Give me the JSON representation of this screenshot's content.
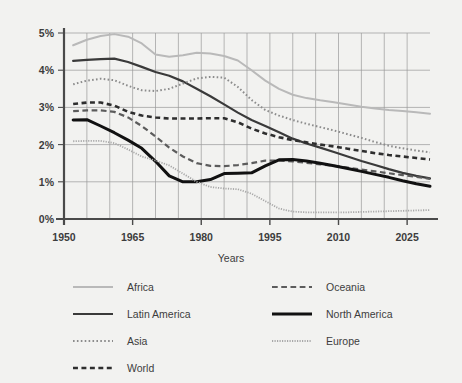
{
  "chart_data": {
    "type": "line",
    "title": "",
    "xlabel": "Years",
    "ylabel": "",
    "xlim": [
      1950,
      2030
    ],
    "ylim": [
      0,
      5
    ],
    "grid": true,
    "legend_position": "bottom",
    "y_ticks": [
      "0%",
      "1%",
      "2%",
      "3%",
      "4%",
      "5%"
    ],
    "y_tick_values": [
      0,
      1,
      2,
      3,
      4,
      5
    ],
    "x_ticks": [
      "1950",
      "1965",
      "1980",
      "1995",
      "2010",
      "2025"
    ],
    "x_tick_values": [
      1950,
      1965,
      1980,
      1995,
      2010,
      2025
    ],
    "x_minor_step": 5,
    "series": [
      {
        "name": "Africa",
        "color": "#b9b9b9",
        "style": "solid",
        "width": 2.0,
        "x": [
          1952,
          1955,
          1958,
          1961,
          1964,
          1967,
          1970,
          1973,
          1976,
          1979,
          1982,
          1985,
          1988,
          1991,
          1994,
          1997,
          2000,
          2003,
          2006,
          2009,
          2012,
          2015,
          2018,
          2021,
          2024,
          2027,
          2030
        ],
        "values": [
          4.67,
          4.82,
          4.92,
          4.97,
          4.9,
          4.72,
          4.42,
          4.36,
          4.4,
          4.47,
          4.45,
          4.38,
          4.26,
          4.0,
          3.72,
          3.5,
          3.34,
          3.25,
          3.19,
          3.14,
          3.08,
          3.02,
          2.97,
          2.93,
          2.9,
          2.87,
          2.83
        ]
      },
      {
        "name": "Latin America",
        "color": "#3a3a3a",
        "style": "solid",
        "width": 2.2,
        "x": [
          1952,
          1955,
          1958,
          1961,
          1964,
          1967,
          1970,
          1973,
          1976,
          1979,
          1982,
          1985,
          1988,
          1991,
          1994,
          1997,
          2000,
          2003,
          2006,
          2009,
          2012,
          2015,
          2018,
          2021,
          2024,
          2027,
          2030
        ],
        "values": [
          4.25,
          4.28,
          4.3,
          4.31,
          4.22,
          4.09,
          3.95,
          3.85,
          3.7,
          3.5,
          3.3,
          3.08,
          2.86,
          2.66,
          2.5,
          2.33,
          2.16,
          2.03,
          1.92,
          1.8,
          1.68,
          1.56,
          1.45,
          1.34,
          1.24,
          1.16,
          1.09
        ]
      },
      {
        "name": "Asia",
        "color": "#8c8c8c",
        "style": "dotted-fine",
        "width": 2.0,
        "x": [
          1952,
          1955,
          1958,
          1961,
          1964,
          1967,
          1970,
          1973,
          1976,
          1979,
          1982,
          1985,
          1988,
          1991,
          1994,
          1997,
          2000,
          2003,
          2006,
          2009,
          2012,
          2015,
          2018,
          2021,
          2024,
          2027,
          2030
        ],
        "values": [
          3.62,
          3.72,
          3.77,
          3.73,
          3.58,
          3.46,
          3.44,
          3.5,
          3.64,
          3.78,
          3.82,
          3.8,
          3.55,
          3.2,
          2.93,
          2.78,
          2.66,
          2.56,
          2.47,
          2.38,
          2.28,
          2.18,
          2.07,
          1.97,
          1.9,
          1.84,
          1.79
        ]
      },
      {
        "name": "World",
        "color": "#2e2e2e",
        "style": "dashed-thick",
        "width": 2.6,
        "x": [
          1952,
          1955,
          1958,
          1961,
          1964,
          1967,
          1970,
          1973,
          1976,
          1979,
          1982,
          1985,
          1988,
          1991,
          1994,
          1997,
          2000,
          2003,
          2006,
          2009,
          2012,
          2015,
          2018,
          2021,
          2024,
          2027,
          2030
        ],
        "values": [
          3.09,
          3.13,
          3.13,
          3.05,
          2.88,
          2.78,
          2.73,
          2.7,
          2.7,
          2.7,
          2.71,
          2.71,
          2.6,
          2.43,
          2.3,
          2.2,
          2.12,
          2.06,
          2.0,
          1.95,
          1.89,
          1.83,
          1.77,
          1.72,
          1.68,
          1.64,
          1.6
        ]
      },
      {
        "name": "Oceania",
        "color": "#5c5c5c",
        "style": "dashed",
        "width": 2.2,
        "x": [
          1952,
          1955,
          1958,
          1961,
          1964,
          1967,
          1970,
          1973,
          1976,
          1979,
          1982,
          1985,
          1988,
          1991,
          1994,
          1997,
          2000,
          2003,
          2006,
          2009,
          2012,
          2015,
          2018,
          2021,
          2024,
          2027,
          2030
        ],
        "values": [
          2.9,
          2.92,
          2.92,
          2.88,
          2.73,
          2.5,
          2.22,
          1.92,
          1.68,
          1.5,
          1.43,
          1.42,
          1.45,
          1.5,
          1.57,
          1.57,
          1.55,
          1.51,
          1.47,
          1.43,
          1.38,
          1.33,
          1.28,
          1.23,
          1.18,
          1.13,
          1.08
        ]
      },
      {
        "name": "North America",
        "color": "#111111",
        "style": "solid",
        "width": 3.0,
        "x": [
          1952,
          1955,
          1958,
          1961,
          1964,
          1967,
          1970,
          1973,
          1976,
          1979,
          1982,
          1985,
          1988,
          1991,
          1994,
          1997,
          2000,
          2003,
          2006,
          2009,
          2012,
          2015,
          2018,
          2021,
          2024,
          2027,
          2030
        ],
        "values": [
          2.66,
          2.67,
          2.5,
          2.32,
          2.12,
          1.9,
          1.55,
          1.16,
          1.0,
          1.0,
          1.06,
          1.22,
          1.23,
          1.24,
          1.43,
          1.59,
          1.6,
          1.56,
          1.5,
          1.43,
          1.36,
          1.28,
          1.2,
          1.12,
          1.03,
          0.95,
          0.88
        ]
      },
      {
        "name": "Europe",
        "color": "#a8a8a8",
        "style": "dotted-tiny",
        "width": 1.8,
        "x": [
          1952,
          1955,
          1958,
          1961,
          1964,
          1967,
          1970,
          1973,
          1976,
          1979,
          1982,
          1985,
          1988,
          1991,
          1994,
          1997,
          2000,
          2003,
          2006,
          2009,
          2012,
          2015,
          2018,
          2021,
          2024,
          2027,
          2030
        ],
        "values": [
          2.09,
          2.1,
          2.1,
          2.04,
          1.87,
          1.68,
          1.57,
          1.44,
          1.22,
          1.0,
          0.86,
          0.82,
          0.8,
          0.68,
          0.48,
          0.28,
          0.2,
          0.18,
          0.18,
          0.18,
          0.18,
          0.19,
          0.2,
          0.21,
          0.22,
          0.23,
          0.24
        ]
      }
    ]
  },
  "legend": {
    "entries": [
      {
        "label": "Africa",
        "series": "Africa",
        "column": 0,
        "row": 0
      },
      {
        "label": "Latin America",
        "series": "Latin America",
        "column": 0,
        "row": 1
      },
      {
        "label": "Asia",
        "series": "Asia",
        "column": 0,
        "row": 2
      },
      {
        "label": "World",
        "series": "World",
        "column": 0,
        "row": 3
      },
      {
        "label": "Oceania",
        "series": "Oceania",
        "column": 1,
        "row": 0
      },
      {
        "label": "North America",
        "series": "North America",
        "column": 1,
        "row": 1
      },
      {
        "label": "Europe",
        "series": "Europe",
        "column": 1,
        "row": 2
      }
    ]
  },
  "style": {
    "background": "#f2f2f0",
    "grid_color": "#9a9a9a",
    "axis_color": "#4a4a4a",
    "text_color": "#3d3d3d"
  }
}
